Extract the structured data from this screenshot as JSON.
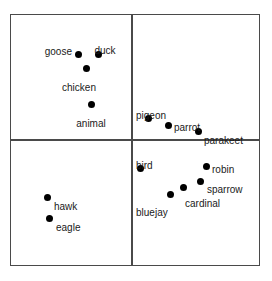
{
  "figure": {
    "title": "",
    "background_color": "#ffffff",
    "line_color": "#4a4a4a",
    "point_color": "#000000",
    "text_color": "#1a1a1a"
  },
  "chart_data": {
    "type": "scatter",
    "title": "",
    "xlabel": "",
    "ylabel": "",
    "xlim": [
      0,
      272
    ],
    "ylim": [
      281,
      0
    ],
    "grid": true,
    "legend": "none",
    "grid_lines": {
      "vertical_x": 131,
      "horizontal_y": 139,
      "box": {
        "left": 10,
        "top": 14,
        "right": 260,
        "bottom": 266
      }
    },
    "quadrants": [
      {
        "name": "top-left",
        "labels": [
          "goose",
          "duck",
          "chicken",
          "animal"
        ]
      },
      {
        "name": "top-right",
        "labels": [
          "pigeon",
          "parrot",
          "parakeet"
        ]
      },
      {
        "name": "bottom-left",
        "labels": [
          "hawk",
          "eagle"
        ]
      },
      {
        "name": "bottom-right",
        "labels": [
          "bird",
          "robin",
          "sparrow",
          "cardinal",
          "bluejay"
        ]
      }
    ],
    "points": [
      {
        "label": "goose",
        "x": 78,
        "y": 54,
        "label_x": 72,
        "label_y": 46,
        "anchor": "end"
      },
      {
        "label": "duck",
        "x": 98,
        "y": 54,
        "label_x": 105,
        "label_y": 45,
        "anchor": "middle"
      },
      {
        "label": "chicken",
        "x": 86,
        "y": 68,
        "label_x": 79,
        "label_y": 82,
        "anchor": "middle"
      },
      {
        "label": "animal",
        "x": 91,
        "y": 104,
        "label_x": 91,
        "label_y": 118,
        "anchor": "middle"
      },
      {
        "label": "pigeon",
        "x": 148,
        "y": 118,
        "label_x": 136,
        "label_y": 110,
        "anchor": "start"
      },
      {
        "label": "parrot",
        "x": 168,
        "y": 125,
        "label_x": 174,
        "label_y": 122,
        "anchor": "start"
      },
      {
        "label": "parakeet",
        "x": 198,
        "y": 131,
        "label_x": 204,
        "label_y": 135,
        "anchor": "start"
      },
      {
        "label": "hawk",
        "x": 47,
        "y": 197,
        "label_x": 54,
        "label_y": 201,
        "anchor": "start"
      },
      {
        "label": "eagle",
        "x": 49,
        "y": 218,
        "label_x": 56,
        "label_y": 222,
        "anchor": "start"
      },
      {
        "label": "bird",
        "x": 140,
        "y": 168,
        "label_x": 136,
        "label_y": 160,
        "anchor": "start"
      },
      {
        "label": "robin",
        "x": 206,
        "y": 166,
        "label_x": 212,
        "label_y": 164,
        "anchor": "start"
      },
      {
        "label": "sparrow",
        "x": 200,
        "y": 181,
        "label_x": 207,
        "label_y": 184,
        "anchor": "start"
      },
      {
        "label": "cardinal",
        "x": 183,
        "y": 187,
        "label_x": 185,
        "label_y": 198,
        "anchor": "start"
      },
      {
        "label": "bluejay",
        "x": 170,
        "y": 194,
        "label_x": 136,
        "label_y": 207,
        "anchor": "start"
      }
    ]
  }
}
